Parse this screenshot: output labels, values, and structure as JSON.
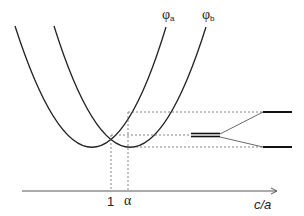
{
  "diagram": {
    "curves": [
      {
        "name": "phi_a",
        "label_main": "φ",
        "label_sub": "a"
      },
      {
        "name": "phi_b",
        "label_main": "φ",
        "label_sub": "b"
      }
    ],
    "axis": {
      "label": "c/a",
      "ticks": [
        {
          "label": "1"
        },
        {
          "label": "α"
        }
      ]
    },
    "levels": {
      "degenerate": "double level",
      "split": [
        "upper level",
        "lower level"
      ]
    },
    "colors": {
      "line": "#222222",
      "dashed": "#666666"
    }
  }
}
